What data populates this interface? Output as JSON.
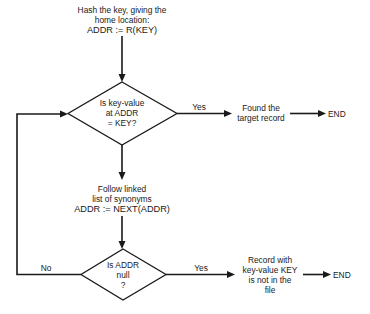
{
  "diagram": {
    "type": "flowchart",
    "colors": {
      "line": "#1a1a1a",
      "background": "#ffffff"
    },
    "nodes": {
      "hash_step": {
        "lines": [
          "Hash the key, giving the",
          "home location:",
          "ADDR := R(KEY)"
        ]
      },
      "compare_decision": {
        "lines": [
          "Is key-value",
          "at ADDR",
          "= KEY?"
        ]
      },
      "found_result": {
        "lines": [
          "Found the",
          "target record"
        ]
      },
      "end_found": {
        "label": "END"
      },
      "follow_step": {
        "lines": [
          "Follow linked",
          "list of synonyms",
          "ADDR := NEXT(ADDR)"
        ]
      },
      "null_decision": {
        "lines": [
          "Is ADDR",
          "null",
          "?"
        ]
      },
      "not_found_result": {
        "lines": [
          "Record with",
          "key-value KEY",
          "is not in the",
          "file"
        ]
      },
      "end_not_found": {
        "label": "END"
      }
    },
    "edges": {
      "compare_yes": {
        "label": "Yes"
      },
      "null_yes": {
        "label": "Yes"
      },
      "null_no": {
        "label": "No"
      }
    }
  }
}
